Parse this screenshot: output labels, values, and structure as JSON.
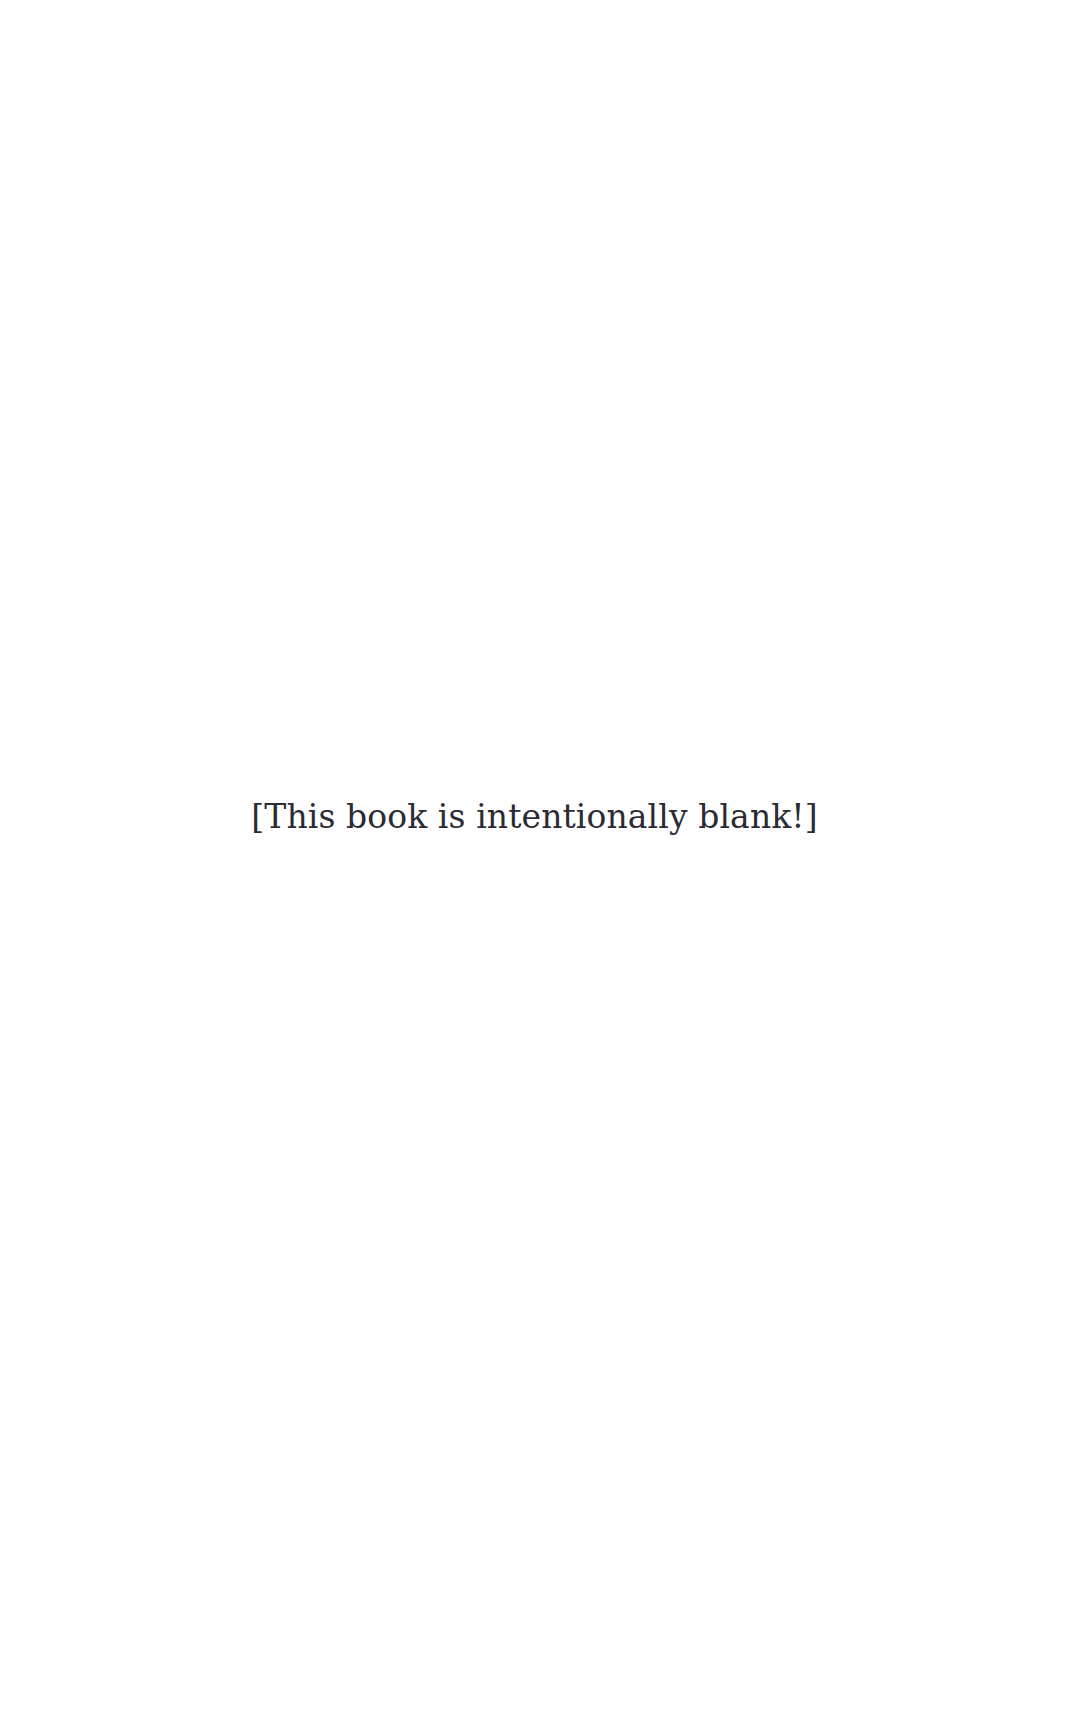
{
  "page": {
    "background_color": "#ffffff",
    "width": 1069,
    "height": 1721
  },
  "content": {
    "notice_text": "[This book is intentionally blank!]",
    "notice_color": "#2b2b33"
  },
  "regions": {
    "top_blank_label": "",
    "bottom_blank_label": ""
  }
}
